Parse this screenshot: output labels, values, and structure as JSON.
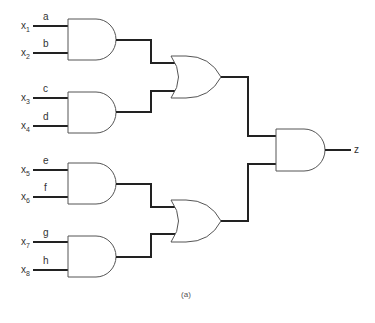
{
  "diagram": {
    "type": "logic-circuit",
    "caption": "(a)",
    "output_label": "z",
    "inputs": [
      {
        "var": "x",
        "sub": "1",
        "wire": "a"
      },
      {
        "var": "x",
        "sub": "2",
        "wire": "b"
      },
      {
        "var": "x",
        "sub": "3",
        "wire": "c"
      },
      {
        "var": "x",
        "sub": "4",
        "wire": "d"
      },
      {
        "var": "x",
        "sub": "5",
        "wire": "e"
      },
      {
        "var": "x",
        "sub": "6",
        "wire": "f"
      },
      {
        "var": "x",
        "sub": "7",
        "wire": "g"
      },
      {
        "var": "x",
        "sub": "8",
        "wire": "h"
      }
    ],
    "gates": [
      {
        "id": "and1",
        "type": "AND",
        "inputs": [
          "a",
          "b"
        ]
      },
      {
        "id": "and2",
        "type": "AND",
        "inputs": [
          "c",
          "d"
        ]
      },
      {
        "id": "and3",
        "type": "AND",
        "inputs": [
          "e",
          "f"
        ]
      },
      {
        "id": "and4",
        "type": "AND",
        "inputs": [
          "g",
          "h"
        ]
      },
      {
        "id": "or1",
        "type": "OR",
        "inputs": [
          "and1",
          "and2"
        ]
      },
      {
        "id": "or2",
        "type": "OR",
        "inputs": [
          "and3",
          "and4"
        ]
      },
      {
        "id": "and5",
        "type": "AND",
        "inputs": [
          "or1",
          "or2"
        ],
        "output": "z"
      }
    ]
  }
}
